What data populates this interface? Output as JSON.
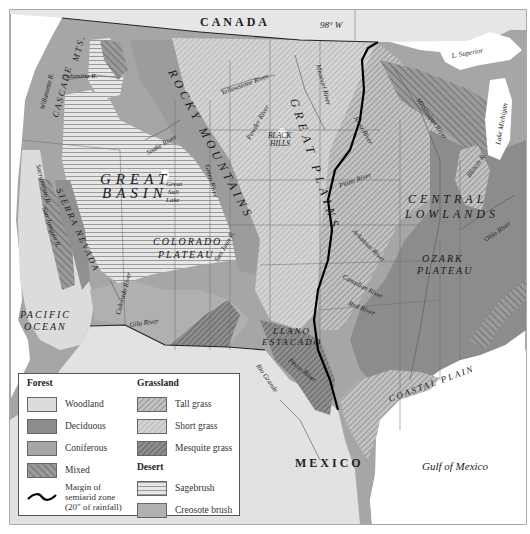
{
  "map": {
    "title_labels": {
      "canada": "CANADA",
      "meridian": "98° W",
      "mexico": "MEXICO",
      "pacific_ocean_line1": "PACIFIC",
      "pacific_ocean_line2": "OCEAN",
      "gulf_of_mexico": "Gulf of Mexico"
    },
    "regions": {
      "cascade_mts_1": "CASCADE",
      "cascade_mts_2": "MTS.",
      "rocky_mountains": "ROCKY MOUNTAINS",
      "great_plains": "GREAT PLAINS",
      "great_basin_1": "GREAT",
      "great_basin_2": "BASIN",
      "sierra_nevada": "SIERRA NEVADA",
      "colorado_plateau_1": "COLORADO",
      "colorado_plateau_2": "PLATEAU",
      "central_lowlands_1": "CENTRAL",
      "central_lowlands_2": "LOWLANDS",
      "ozark_plateau_1": "OZARK",
      "ozark_plateau_2": "PLATEAU",
      "llano_estacado_1": "LLANO",
      "llano_estacado_2": "ESTACADO",
      "coastal_plain": "COASTAL PLAIN",
      "black_hills_1": "BLACK",
      "black_hills_2": "HILLS"
    },
    "water_features": {
      "columbia_river": "Columbia R.",
      "willamette_river": "Willamette R.",
      "sacramento_river": "Sacramento R.",
      "san_joaquin_river": "San Joaquin R.",
      "snake_river": "Snake River",
      "yellowstone_river": "Yellowstone River",
      "powder_river": "Powder River",
      "missouri_river": "Missouri River",
      "green_river": "Green River",
      "great_salt_lake_1": "Great",
      "great_salt_lake_2": "Salt",
      "great_salt_lake_3": "Lake",
      "colorado_river": "Colorado River",
      "gila_river": "Gila River",
      "san_juan_river": "San Juan R.",
      "rio_grande": "Rio Grande",
      "pecos_river": "Pecos River",
      "platte_river": "Platte River",
      "iowa_river": "Iowa River",
      "arkansas_river": "Arkansas River",
      "canadian_river": "Canadian River",
      "red_river": "Red River",
      "mississippi_river": "Mississippi River",
      "illinois_river": "Illinois R.",
      "ohio_river": "Ohio River",
      "lake_superior": "L. Superior",
      "lake_michigan": "Lake Michigan"
    }
  },
  "legend": {
    "forest_heading": "Forest",
    "grassland_heading": "Grassland",
    "desert_heading": "Desert",
    "forest_items": [
      {
        "label": "Woodland",
        "key": "woodland"
      },
      {
        "label": "Deciduous",
        "key": "deciduous"
      },
      {
        "label": "Coniferous",
        "key": "coniferous"
      },
      {
        "label": "Mixed",
        "key": "mixed"
      }
    ],
    "grassland_items": [
      {
        "label": "Tall grass",
        "key": "tall-grass"
      },
      {
        "label": "Short grass",
        "key": "short-grass"
      },
      {
        "label": "Mesquite grass",
        "key": "mesquite-grass"
      }
    ],
    "desert_items": [
      {
        "label": "Sagebrush",
        "key": "sagebrush"
      },
      {
        "label": "Creosote brush",
        "key": "creosote-brush"
      }
    ],
    "margin_line1": "Margin of",
    "margin_line2": "semiarid zone",
    "margin_line3": "(20\" of rainfall)"
  },
  "colors": {
    "woodland": "#dcdcdc",
    "deciduous": "#8c8c8c",
    "coniferous": "#a6a6a6",
    "creosote": "#b8b8b8",
    "water": "#ffffff",
    "canada": "#e8e8e8",
    "margin_line": "#000000"
  }
}
